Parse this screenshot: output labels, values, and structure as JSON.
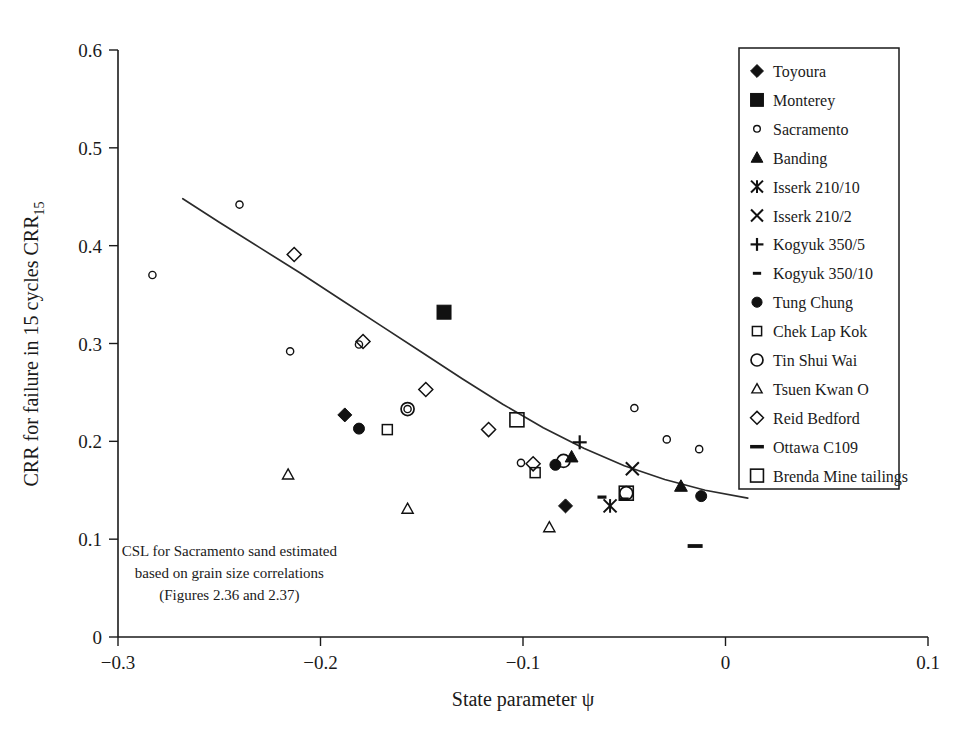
{
  "chart_data": {
    "type": "scatter",
    "title": "",
    "xlabel": "State parameter ψ",
    "ylabel": "CRR for failure in 15 cycles CRR₁₅",
    "ylabel_main": "CRR for failure in 15 cycles CRR",
    "ylabel_sub": "15",
    "xlim": [
      -0.3,
      0.1
    ],
    "ylim": [
      0,
      0.6
    ],
    "xticks": [
      -0.3,
      -0.2,
      -0.1,
      0,
      0.1
    ],
    "xtick_labels": [
      "−0.3",
      "−0.2",
      "−0.1",
      "0",
      "0.1"
    ],
    "yticks": [
      0,
      0.1,
      0.2,
      0.3,
      0.4,
      0.5,
      0.6
    ],
    "ytick_labels": [
      "0",
      "0.1",
      "0.2",
      "0.3",
      "0.4",
      "0.5",
      "0.6"
    ],
    "grid": false,
    "legend_position": "top-right",
    "annotation": {
      "lines": [
        "CSL for Sacramento sand estimated",
        "based on grain size correlations",
        "(Figures 2.36 and 2.37)"
      ],
      "x": -0.245,
      "y": 0.083
    },
    "fit_curve": {
      "name": "CSL trend line",
      "x": [
        -0.268,
        -0.25,
        -0.23,
        -0.21,
        -0.19,
        -0.17,
        -0.15,
        -0.13,
        -0.11,
        -0.09,
        -0.07,
        -0.05,
        -0.03,
        -0.01,
        0.011
      ],
      "y": [
        0.448,
        0.424,
        0.398,
        0.372,
        0.345,
        0.318,
        0.291,
        0.264,
        0.238,
        0.214,
        0.193,
        0.175,
        0.161,
        0.15,
        0.142
      ]
    },
    "series": [
      {
        "name": "Toyoura",
        "marker": "filled-diamond",
        "points": [
          {
            "x": -0.188,
            "y": 0.227
          },
          {
            "x": -0.079,
            "y": 0.134
          }
        ]
      },
      {
        "name": "Monterey",
        "marker": "filled-square",
        "points": [
          {
            "x": -0.139,
            "y": 0.332
          }
        ]
      },
      {
        "name": "Sacramento",
        "marker": "small-open-circle",
        "points": [
          {
            "x": -0.283,
            "y": 0.37
          },
          {
            "x": -0.24,
            "y": 0.442
          },
          {
            "x": -0.215,
            "y": 0.292
          },
          {
            "x": -0.181,
            "y": 0.299
          },
          {
            "x": -0.157,
            "y": 0.233
          },
          {
            "x": -0.101,
            "y": 0.178
          },
          {
            "x": -0.045,
            "y": 0.234
          },
          {
            "x": -0.029,
            "y": 0.202
          },
          {
            "x": -0.013,
            "y": 0.192
          }
        ]
      },
      {
        "name": "Banding",
        "marker": "filled-triangle",
        "points": [
          {
            "x": -0.076,
            "y": 0.184
          },
          {
            "x": -0.022,
            "y": 0.154
          }
        ]
      },
      {
        "name": "Isserk 210/10",
        "marker": "asterisk",
        "points": [
          {
            "x": -0.057,
            "y": 0.134
          }
        ]
      },
      {
        "name": "Isserk 210/2",
        "marker": "cross-x",
        "points": [
          {
            "x": -0.046,
            "y": 0.172
          }
        ]
      },
      {
        "name": "Kogyuk 350/5",
        "marker": "plus",
        "points": [
          {
            "x": -0.072,
            "y": 0.199
          }
        ]
      },
      {
        "name": "Kogyuk 350/10",
        "marker": "small-dash",
        "points": [
          {
            "x": -0.061,
            "y": 0.143
          },
          {
            "x": -0.05,
            "y": 0.141
          }
        ]
      },
      {
        "name": "Tung Chung",
        "marker": "filled-circle",
        "points": [
          {
            "x": -0.181,
            "y": 0.213
          },
          {
            "x": -0.084,
            "y": 0.176
          },
          {
            "x": -0.012,
            "y": 0.144
          }
        ]
      },
      {
        "name": "Chek Lap Kok",
        "marker": "small-open-square",
        "points": [
          {
            "x": -0.167,
            "y": 0.212
          },
          {
            "x": -0.094,
            "y": 0.168
          }
        ]
      },
      {
        "name": "Tin Shui Wai",
        "marker": "open-circle",
        "points": [
          {
            "x": -0.157,
            "y": 0.233
          },
          {
            "x": -0.08,
            "y": 0.18
          },
          {
            "x": -0.049,
            "y": 0.147
          }
        ]
      },
      {
        "name": "Tsuen Kwan O",
        "marker": "open-triangle",
        "points": [
          {
            "x": -0.216,
            "y": 0.166
          },
          {
            "x": -0.157,
            "y": 0.131
          },
          {
            "x": -0.087,
            "y": 0.112
          }
        ]
      },
      {
        "name": "Reid Bedford",
        "marker": "open-diamond",
        "points": [
          {
            "x": -0.213,
            "y": 0.391
          },
          {
            "x": -0.179,
            "y": 0.302
          },
          {
            "x": -0.148,
            "y": 0.253
          },
          {
            "x": -0.117,
            "y": 0.212
          },
          {
            "x": -0.095,
            "y": 0.177
          }
        ]
      },
      {
        "name": "Ottawa C109",
        "marker": "long-dash",
        "points": [
          {
            "x": -0.015,
            "y": 0.093
          }
        ]
      },
      {
        "name": "Brenda Mine tailings",
        "marker": "open-square",
        "points": [
          {
            "x": -0.103,
            "y": 0.222
          },
          {
            "x": -0.049,
            "y": 0.147
          }
        ]
      }
    ]
  },
  "legend": {
    "items": [
      {
        "label": "Toyoura",
        "marker": "filled-diamond"
      },
      {
        "label": "Monterey",
        "marker": "filled-square"
      },
      {
        "label": "Sacramento",
        "marker": "small-open-circle"
      },
      {
        "label": "Banding",
        "marker": "filled-triangle"
      },
      {
        "label": "Isserk 210/10",
        "marker": "asterisk"
      },
      {
        "label": "Isserk 210/2",
        "marker": "cross-x"
      },
      {
        "label": "Kogyuk 350/5",
        "marker": "plus"
      },
      {
        "label": "Kogyuk 350/10",
        "marker": "small-dash"
      },
      {
        "label": "Tung Chung",
        "marker": "filled-circle"
      },
      {
        "label": "Chek Lap Kok",
        "marker": "small-open-square"
      },
      {
        "label": "Tin Shui Wai",
        "marker": "open-circle"
      },
      {
        "label": "Tsuen Kwan O",
        "marker": "open-triangle"
      },
      {
        "label": "Reid Bedford",
        "marker": "open-diamond"
      },
      {
        "label": "Ottawa C109",
        "marker": "long-dash"
      },
      {
        "label": "Brenda Mine tailings",
        "marker": "open-square"
      }
    ]
  },
  "colors": {
    "ink": "#1a1a1a",
    "curve": "#2b2b2b",
    "background": "#ffffff"
  }
}
